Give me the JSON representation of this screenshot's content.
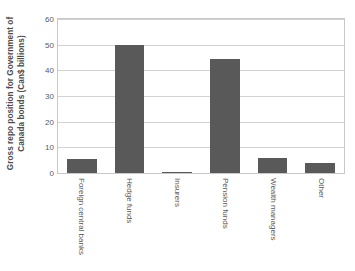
{
  "chart_data": {
    "type": "bar",
    "title": "",
    "subtitle": "",
    "xlabel": "",
    "ylabel_lines": [
      "Gross repo position for Government of",
      "Canada bonds (Can$ billions)"
    ],
    "ylabel": "Gross repo position for Government of Canada bonds (Can$ billions)",
    "categories": [
      "Foreign central banks",
      "Hedge funds",
      "Insurers",
      "Pension funds",
      "Wealth managers",
      "Other"
    ],
    "values": [
      5.5,
      50,
      0.2,
      44.5,
      6,
      4
    ],
    "ylim": [
      0,
      60
    ],
    "yticks": [
      0,
      10,
      20,
      30,
      40,
      50,
      60
    ],
    "ytick_labels": [
      "0",
      "10",
      "20",
      "30",
      "40",
      "50",
      "60"
    ],
    "grid": true,
    "legend": false,
    "legend_position": "none",
    "bar_color": "#595959",
    "grid_color": "#d2d2d2",
    "axis_color": "#c8c8c8",
    "background_color": "#ffffff"
  }
}
